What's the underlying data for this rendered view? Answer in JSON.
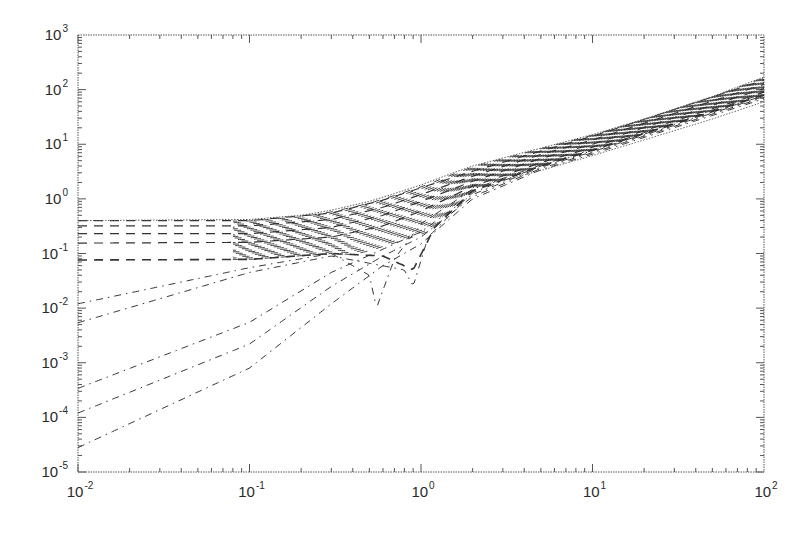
{
  "chart_data": {
    "type": "line",
    "title": "",
    "xlabel": "",
    "ylabel": "",
    "xscale": "log",
    "yscale": "log",
    "xlim": [
      0.01,
      100
    ],
    "ylim": [
      1e-05,
      1000
    ],
    "grid": false,
    "legend": null,
    "x_ticks": [
      {
        "base": "10",
        "exp": "-2",
        "value": 0.01
      },
      {
        "base": "10",
        "exp": "-1",
        "value": 0.1
      },
      {
        "base": "10",
        "exp": "0",
        "value": 1
      },
      {
        "base": "10",
        "exp": "1",
        "value": 10
      },
      {
        "base": "10",
        "exp": "2",
        "value": 100
      }
    ],
    "y_ticks": [
      {
        "base": "10",
        "exp": "3",
        "value": 1000
      },
      {
        "base": "10",
        "exp": "2",
        "value": 100
      },
      {
        "base": "10",
        "exp": "1",
        "value": 10
      },
      {
        "base": "10",
        "exp": "0",
        "value": 1
      },
      {
        "base": "10",
        "exp": "-1",
        "value": 0.1
      },
      {
        "base": "10",
        "exp": "-2",
        "value": 0.01
      },
      {
        "base": "10",
        "exp": "-3",
        "value": 0.001
      },
      {
        "base": "10",
        "exp": "-4",
        "value": 0.0001
      },
      {
        "base": "10",
        "exp": "-5",
        "value": 1e-05
      }
    ],
    "upper_envelope": {
      "name": "upper bound (dotted)",
      "x": [
        0.01,
        0.1,
        0.2,
        0.3,
        0.5,
        0.7,
        1,
        1.5,
        2,
        3,
        5,
        10,
        20,
        50,
        100
      ],
      "y": [
        0.4,
        0.42,
        0.5,
        0.62,
        0.9,
        1.25,
        1.8,
        2.9,
        4.0,
        5.6,
        8.5,
        15,
        29,
        75,
        170
      ]
    },
    "lower_envelope": {
      "name": "lower bound (dotted)",
      "x": [
        2,
        3,
        5,
        10,
        20,
        50,
        100
      ],
      "y": [
        1.6,
        2.2,
        3.3,
        6.2,
        12,
        29,
        60
      ]
    },
    "series": [
      {
        "name": "plateau-1",
        "style": "dashed",
        "low_x_value": 0.4,
        "x": [
          0.01,
          0.1,
          0.3,
          0.6,
          1,
          2,
          5,
          10,
          100
        ],
        "y": [
          0.4,
          0.4,
          0.55,
          0.95,
          1.6,
          3.2,
          7.5,
          14,
          150
        ]
      },
      {
        "name": "plateau-2",
        "style": "dashed",
        "low_x_value": 0.32,
        "x": [
          0.01,
          0.1,
          0.3,
          0.6,
          1,
          2,
          5,
          10,
          100
        ],
        "y": [
          0.32,
          0.32,
          0.42,
          0.7,
          1.2,
          2.6,
          6.5,
          12,
          125
        ]
      },
      {
        "name": "plateau-3",
        "style": "dashed",
        "low_x_value": 0.23,
        "x": [
          0.01,
          0.1,
          0.3,
          0.6,
          1,
          2,
          5,
          10,
          100
        ],
        "y": [
          0.23,
          0.23,
          0.3,
          0.5,
          0.9,
          2.1,
          5.5,
          10,
          105
        ]
      },
      {
        "name": "plateau-4",
        "style": "dashed",
        "low_x_value": 0.155,
        "x": [
          0.01,
          0.1,
          0.3,
          0.6,
          1,
          2,
          5,
          10,
          100
        ],
        "y": [
          0.155,
          0.16,
          0.2,
          0.32,
          0.6,
          1.7,
          4.6,
          8.8,
          90
        ]
      },
      {
        "name": "plateau-5",
        "style": "dashed",
        "low_x_value": 0.076,
        "x": [
          0.01,
          0.1,
          0.3,
          0.6,
          0.9,
          1.2,
          2,
          5,
          10,
          100
        ],
        "y": [
          0.076,
          0.078,
          0.1,
          0.09,
          0.05,
          0.3,
          1.4,
          4.0,
          7.8,
          80
        ]
      },
      {
        "name": "power-law-1",
        "style": "dash-dot",
        "low_x_value": 0.012,
        "x": [
          0.01,
          0.1,
          0.3,
          0.5,
          0.55,
          0.7,
          1,
          2,
          5,
          10,
          100
        ],
        "y": [
          0.012,
          0.055,
          0.1,
          0.04,
          0.01,
          0.08,
          0.35,
          1.5,
          4.2,
          8,
          85
        ]
      },
      {
        "name": "power-law-2",
        "style": "dash-dot",
        "low_x_value": 0.0054,
        "x": [
          0.01,
          0.1,
          0.3,
          0.8,
          0.9,
          1.1,
          2,
          5,
          10,
          100
        ],
        "y": [
          0.0054,
          0.045,
          0.09,
          0.05,
          0.025,
          0.2,
          1.3,
          4.0,
          7.6,
          78
        ]
      },
      {
        "name": "power-law-3",
        "style": "dash-dot",
        "low_x_value": 0.00034,
        "x": [
          0.01,
          0.1,
          0.3,
          0.6,
          1,
          2,
          5,
          10,
          100
        ],
        "y": [
          0.00034,
          0.0055,
          0.045,
          0.12,
          0.25,
          1.2,
          3.8,
          7.3,
          75
        ]
      },
      {
        "name": "power-law-4",
        "style": "dash-dot",
        "low_x_value": 0.00012,
        "x": [
          0.01,
          0.1,
          0.3,
          0.6,
          1,
          2,
          5,
          10,
          100
        ],
        "y": [
          0.00012,
          0.0022,
          0.025,
          0.09,
          0.2,
          1.1,
          3.6,
          7.0,
          72
        ]
      },
      {
        "name": "power-law-5",
        "style": "dash-dot",
        "low_x_value": 2.8e-05,
        "x": [
          0.01,
          0.1,
          0.3,
          0.6,
          1,
          2,
          5,
          10,
          100
        ],
        "y": [
          2.8e-05,
          0.0008,
          0.012,
          0.06,
          0.15,
          1.0,
          3.4,
          6.6,
          68
        ]
      }
    ],
    "annotations": []
  },
  "figure": {
    "background": "#ffffff",
    "line_color": "#333333",
    "axis_color": "#555555",
    "band_color": "#222222"
  }
}
